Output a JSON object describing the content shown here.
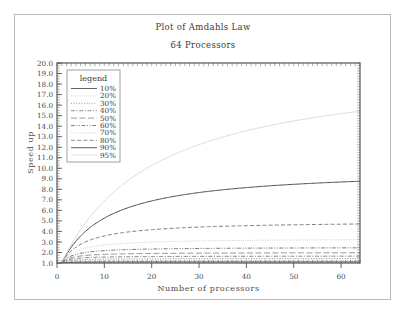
{
  "chart_data": {
    "type": "line",
    "title": "Plot of Amdahls Law",
    "subtitle": "64 Processors",
    "xlabel": "Number of processors",
    "ylabel": "Speed up",
    "xlim": [
      0,
      64
    ],
    "ylim": [
      1.0,
      20.0
    ],
    "xticks": [
      0,
      10,
      20,
      30,
      40,
      50,
      60
    ],
    "yticks": [
      1.0,
      2.0,
      3.0,
      4.0,
      5.0,
      6.0,
      7.0,
      8.0,
      9.0,
      10.0,
      11.0,
      12.0,
      13.0,
      14.0,
      15.0,
      16.0,
      17.0,
      18.0,
      19.0,
      20.0
    ],
    "ytick_labels": [
      "1.0",
      "2.0",
      "3.0",
      "4.0",
      "5.0",
      "6.0",
      "7.0",
      "8.0",
      "9.0",
      "10.0",
      "11.0",
      "12.0",
      "13.0",
      "14.0",
      "15.0",
      "16.0",
      "17.0",
      "18.0",
      "19.0",
      "20.0"
    ],
    "xtick_labels": [
      "0",
      "10",
      "20",
      "30",
      "40",
      "50",
      "60"
    ],
    "grid": false,
    "legend_title": "legend",
    "legend_position": "upper-left-inside",
    "x": [
      1,
      2,
      4,
      8,
      12,
      16,
      20,
      24,
      28,
      32,
      36,
      40,
      44,
      48,
      52,
      56,
      60,
      64
    ],
    "series": [
      {
        "name": "10%",
        "parallel_fraction": 0.1,
        "dash": "solid",
        "color": "#555555",
        "values": [
          1.0,
          1.05,
          1.08,
          1.1,
          1.1,
          1.1,
          1.1,
          1.11,
          1.11,
          1.11,
          1.11,
          1.11,
          1.11,
          1.11,
          1.11,
          1.11,
          1.11,
          1.11
        ],
        "final_value": 1.11
      },
      {
        "name": "20%",
        "parallel_fraction": 0.2,
        "dash": "dotted-fine",
        "color": "#9a9a9a",
        "values": [
          1.0,
          1.11,
          1.18,
          1.21,
          1.23,
          1.23,
          1.23,
          1.24,
          1.24,
          1.24,
          1.24,
          1.24,
          1.24,
          1.24,
          1.24,
          1.24,
          1.24,
          1.24
        ],
        "final_value": 1.24
      },
      {
        "name": "30%",
        "parallel_fraction": 0.3,
        "dash": "dotted",
        "color": "#7a7a7a",
        "values": [
          1.0,
          1.18,
          1.29,
          1.35,
          1.38,
          1.39,
          1.4,
          1.4,
          1.4,
          1.41,
          1.41,
          1.41,
          1.41,
          1.41,
          1.41,
          1.42,
          1.42,
          1.42
        ],
        "final_value": 1.42
      },
      {
        "name": "40%",
        "parallel_fraction": 0.4,
        "dash": "dash-dot",
        "color": "#6a6a6a",
        "values": [
          1.0,
          1.25,
          1.43,
          1.54,
          1.58,
          1.6,
          1.61,
          1.62,
          1.62,
          1.63,
          1.63,
          1.63,
          1.64,
          1.64,
          1.64,
          1.64,
          1.64,
          1.64
        ],
        "final_value": 1.64
      },
      {
        "name": "50%",
        "parallel_fraction": 0.5,
        "dash": "long-dash",
        "color": "#808080",
        "values": [
          1.0,
          1.33,
          1.6,
          1.78,
          1.85,
          1.88,
          1.9,
          1.92,
          1.93,
          1.94,
          1.95,
          1.95,
          1.96,
          1.96,
          1.96,
          1.96,
          1.97,
          1.97
        ],
        "final_value": 1.97
      },
      {
        "name": "60%",
        "parallel_fraction": 0.6,
        "dash": "dash-dot-dot",
        "color": "#5a5a5a",
        "values": [
          1.0,
          1.43,
          1.82,
          2.1,
          2.22,
          2.29,
          2.33,
          2.36,
          2.38,
          2.4,
          2.41,
          2.42,
          2.43,
          2.44,
          2.44,
          2.45,
          2.45,
          2.46
        ],
        "final_value": 2.46
      },
      {
        "name": "70%",
        "parallel_fraction": 0.7,
        "dash": "dotted-light",
        "color": "#b0b0b0",
        "values": [
          1.0,
          1.54,
          2.11,
          2.58,
          2.8,
          2.93,
          3.02,
          3.08,
          3.12,
          3.16,
          3.19,
          3.21,
          3.23,
          3.25,
          3.26,
          3.27,
          3.28,
          3.29
        ],
        "final_value": 3.29
      },
      {
        "name": "80%",
        "parallel_fraction": 0.8,
        "dash": "dashed",
        "color": "#666666",
        "values": [
          1.0,
          1.67,
          2.5,
          3.33,
          3.81,
          4.12,
          4.35,
          4.52,
          4.65,
          4.76,
          4.85,
          4.92,
          4.98,
          5.04,
          5.08,
          5.12,
          5.16,
          5.19
        ],
        "final_value": 4.71
      },
      {
        "name": "90%",
        "parallel_fraction": 0.9,
        "dash": "solid",
        "color": "#4a4a4a",
        "values": [
          1.0,
          1.82,
          3.08,
          4.71,
          5.71,
          6.4,
          6.9,
          7.3,
          7.61,
          7.87,
          8.09,
          8.28,
          8.44,
          8.58,
          8.7,
          8.81,
          8.9,
          8.99
        ],
        "final_value": 8.8
      },
      {
        "name": "95%",
        "parallel_fraction": 0.95,
        "dash": "solid-light",
        "color": "#d4d4d4",
        "values": [
          1.0,
          1.9,
          3.48,
          5.93,
          7.74,
          9.14,
          10.26,
          11.17,
          11.93,
          12.57,
          13.12,
          13.59,
          14.01,
          14.38,
          14.71,
          15.0,
          15.26,
          15.5
        ],
        "final_value": 15.45
      }
    ]
  }
}
